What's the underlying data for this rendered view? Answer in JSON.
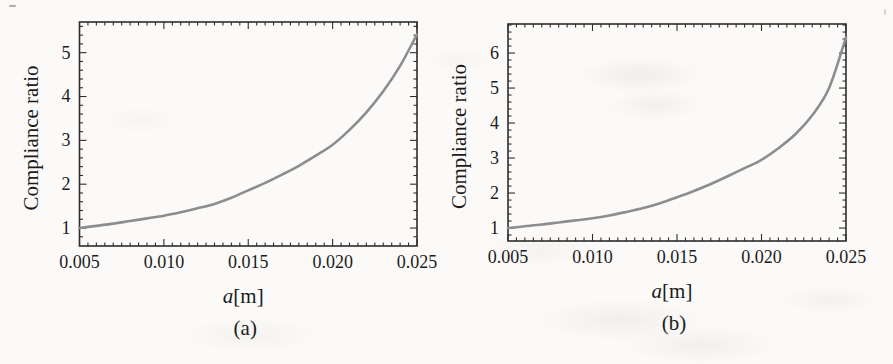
{
  "figure": {
    "description_text": "",
    "frame_color": "#2e2e2e",
    "text_color": "#1c1c1c"
  },
  "chart_data": [
    {
      "type": "line",
      "title": "",
      "xlabel": "a[m]",
      "ylabel": "Compliance ratio",
      "caption": "(a)",
      "xlim": [
        0.005,
        0.025
      ],
      "ylim": [
        0.59,
        5.7
      ],
      "x_ticks": [
        0.005,
        0.01,
        0.015,
        0.02,
        0.025
      ],
      "x_tick_labels": [
        "0.005",
        "0.010",
        "0.015",
        "0.020",
        "0.025"
      ],
      "y_ticks": [
        1,
        2,
        3,
        4,
        5
      ],
      "y_tick_labels": [
        "1",
        "2",
        "3",
        "4",
        "5"
      ],
      "x_minor_step": 0.0005,
      "y_minor_step": 0.2,
      "grid": false,
      "legend": "none",
      "series": [
        {
          "name": "compliance-ratio-curve",
          "color": "#8d8d8d",
          "x": [
            0.005,
            0.006,
            0.007,
            0.008,
            0.009,
            0.01,
            0.011,
            0.012,
            0.013,
            0.014,
            0.015,
            0.016,
            0.017,
            0.018,
            0.019,
            0.02,
            0.021,
            0.022,
            0.023,
            0.024,
            0.025
          ],
          "y": [
            1.0,
            1.05,
            1.1,
            1.16,
            1.22,
            1.28,
            1.36,
            1.45,
            1.55,
            1.69,
            1.86,
            2.03,
            2.22,
            2.42,
            2.65,
            2.9,
            3.24,
            3.64,
            4.12,
            4.7,
            5.42
          ]
        }
      ]
    },
    {
      "type": "line",
      "title": "",
      "xlabel": "a[m]",
      "ylabel": "Compliance ratio",
      "caption": "(b)",
      "xlim": [
        0.005,
        0.025
      ],
      "ylim": [
        0.63,
        6.83
      ],
      "x_ticks": [
        0.005,
        0.01,
        0.015,
        0.02,
        0.025
      ],
      "x_tick_labels": [
        "0.005",
        "0.010",
        "0.015",
        "0.020",
        "0.025"
      ],
      "y_ticks": [
        1,
        2,
        3,
        4,
        5,
        6
      ],
      "y_tick_labels": [
        "1",
        "2",
        "3",
        "4",
        "5",
        "6"
      ],
      "x_minor_step": 0.0005,
      "y_minor_step": 0.2,
      "grid": false,
      "legend": "none",
      "series": [
        {
          "name": "compliance-ratio-curve",
          "color": "#8d8d8d",
          "x": [
            0.005,
            0.006,
            0.007,
            0.008,
            0.009,
            0.01,
            0.011,
            0.012,
            0.013,
            0.014,
            0.015,
            0.016,
            0.017,
            0.018,
            0.019,
            0.02,
            0.021,
            0.022,
            0.023,
            0.024,
            0.025
          ],
          "y": [
            1.0,
            1.05,
            1.1,
            1.16,
            1.22,
            1.28,
            1.36,
            1.46,
            1.57,
            1.71,
            1.88,
            2.06,
            2.26,
            2.48,
            2.71,
            2.95,
            3.28,
            3.68,
            4.22,
            5.0,
            6.45
          ]
        }
      ]
    }
  ]
}
